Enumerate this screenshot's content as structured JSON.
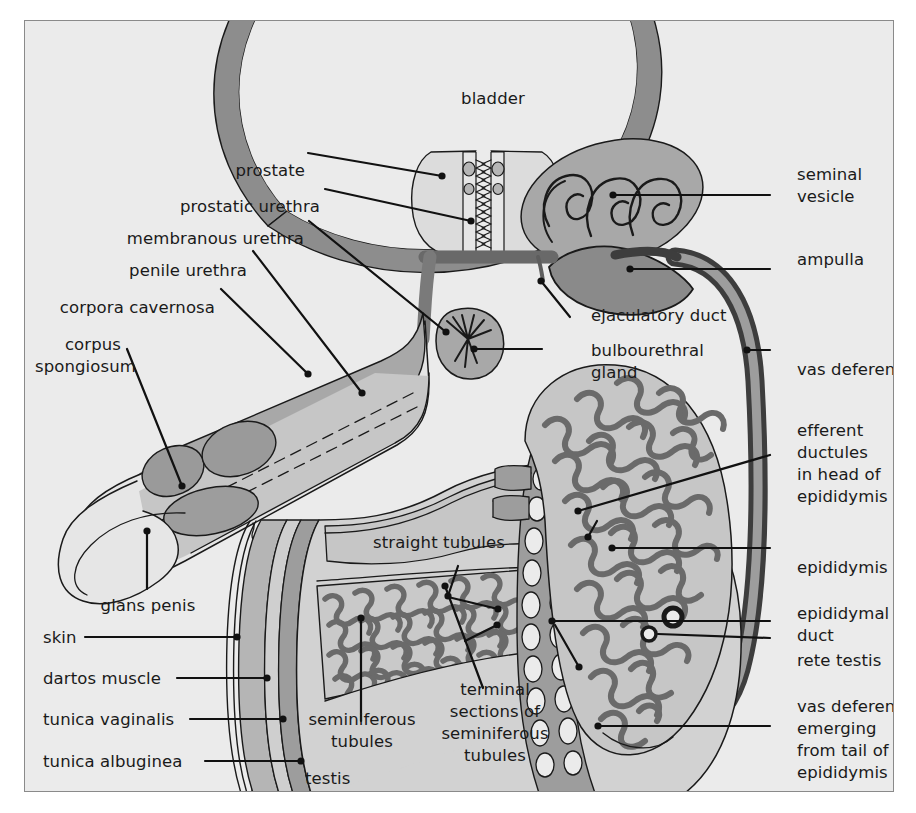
{
  "figure": {
    "background_color": "#ebebeb",
    "page_color": "#ffffff",
    "frame_border_color": "#8a8a8a",
    "ink_color": "#1a1a1a",
    "palette": {
      "light_tissue": "#e3e3e3",
      "mid_tissue": "#bdbdbd",
      "mid_tissue_2": "#adadad",
      "dark_tissue": "#9a9a9a",
      "darker_tissue": "#8d8d8d",
      "duct_dark": "#7a7a7a",
      "duct_darkest": "#6e6e6e",
      "outline": "#1a1a1a"
    }
  },
  "labels": {
    "bladder": "bladder",
    "prostate": "prostate",
    "prostatic_urethra": "prostatic urethra",
    "membranous_urethra": "membranous urethra",
    "penile_urethra": "penile urethra",
    "corpora_cavernosa": "corpora cavernosa",
    "corpus_spongiosum_l1": "corpus",
    "corpus_spongiosum_l2": "spongiosum",
    "glans_penis": "glans penis",
    "skin": "skin",
    "dartos_muscle": "dartos muscle",
    "tunica_vaginalis": "tunica vaginalis",
    "tunica_albuginea": "tunica albuginea",
    "testis": "testis",
    "seminiferous_tubules_l1": "seminiferous",
    "seminiferous_tubules_l2": "tubules",
    "straight_tubules": "straight tubules",
    "terminal_sections_l1": "terminal",
    "terminal_sections_l2": "sections of",
    "terminal_sections_l3": "seminiferous",
    "terminal_sections_l4": "tubules",
    "seminal_vesicle_l1": "seminal",
    "seminal_vesicle_l2": "vesicle",
    "ampulla": "ampulla",
    "ejaculatory_duct": "ejaculatory duct",
    "bulbourethral_gland_l1": "bulbourethral",
    "bulbourethral_gland_l2": "gland",
    "vas_deferens": "vas deferens",
    "efferent_ductules_l1": "efferent",
    "efferent_ductules_l2": "ductules",
    "efferent_ductules_l3": "in head of",
    "efferent_ductules_l4": "epididymis",
    "epididymis": "epididymis",
    "epididymal_duct_l1": "epididymal",
    "epididymal_duct_l2": "duct",
    "rete_testis": "rete testis",
    "vas_deferens_tail_l1": "vas deferens",
    "vas_deferens_tail_l2": "emerging",
    "vas_deferens_tail_l3": "from tail of",
    "vas_deferens_tail_l4": "epididymis"
  }
}
